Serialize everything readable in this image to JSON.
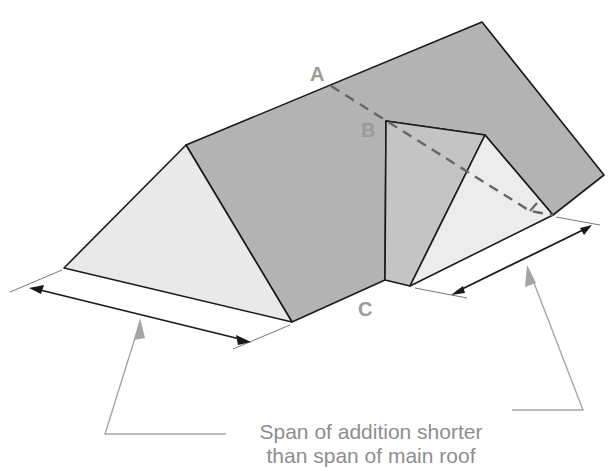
{
  "diagram": {
    "labels": {
      "point_a": "A",
      "point_b": "B",
      "point_c": "C"
    },
    "caption": {
      "line1": "Span of addition shorter",
      "line2": "than span of main roof"
    },
    "colors": {
      "roof_plane": "#b3b3b3",
      "gable_face": "#e9e9e9",
      "outline": "#1a1a1a",
      "dashed_line": "#666666",
      "annotation": "#9a9a9a"
    }
  }
}
